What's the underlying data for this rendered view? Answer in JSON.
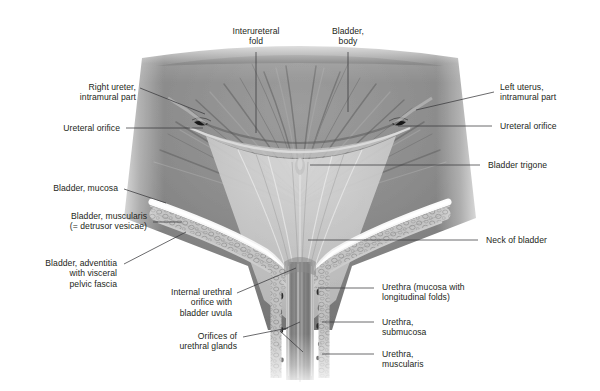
{
  "figure": {
    "kind": "anatomical-illustration",
    "background_color": "#ffffff",
    "label_text_color": "#231f20",
    "leader_line_color": "#3a3a3c"
  },
  "labels": {
    "interureteral_fold": "Interureteral\nfold",
    "bladder_body": "Bladder,\nbody",
    "right_ureter": "Right ureter,\nintramural part",
    "ureteral_orifice_left": "Ureteral orifice",
    "bladder_mucosa": "Bladder, mucosa",
    "bladder_muscularis": "Bladder, muscularis\n(= detrusor vesicae)",
    "bladder_adventitia": "Bladder, adventitia\nwith visceral\npelvic fascia",
    "internal_urethral_orifice": "Internal urethral\norifice with\nbladder uvula",
    "orifices_urethral_glands": "Orifices of\nurethral glands",
    "left_uterus": "Left uterus,\nintramural part",
    "ureteral_orifice_right": "Ureteral orifice",
    "bladder_trigone": "Bladder trigone",
    "neck_of_bladder": "Neck of bladder",
    "urethra_mucosa": "Urethra (mucosa with\nlongitudinal folds)",
    "urethra_submucosa": "Urethra,\nsubmucosa",
    "urethra_muscularis": "Urethra,\nmuscularis"
  }
}
